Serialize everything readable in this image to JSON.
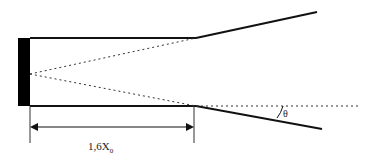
{
  "diagram": {
    "type": "jet-nozzle-schematic",
    "labels": {
      "dimension_main": "1,6X",
      "dimension_sub": "0",
      "angle": "θ"
    },
    "colors": {
      "stroke": "#111111",
      "fill": "#000000",
      "background": "#ffffff"
    }
  }
}
